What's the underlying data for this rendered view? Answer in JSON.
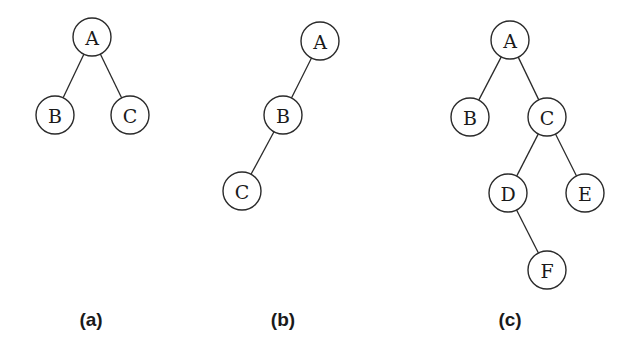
{
  "figure": {
    "node_radius": 19,
    "stroke_color": "#2a2a2a",
    "trees": [
      {
        "id": "a",
        "caption": "(a)",
        "caption_pos": {
          "x": 91,
          "y": 309
        },
        "nodes": [
          {
            "id": "A",
            "label": "A",
            "x": 92,
            "y": 37
          },
          {
            "id": "B",
            "label": "B",
            "x": 55,
            "y": 115
          },
          {
            "id": "C",
            "label": "C",
            "x": 130,
            "y": 115
          }
        ],
        "edges": [
          [
            "A",
            "B"
          ],
          [
            "A",
            "C"
          ]
        ]
      },
      {
        "id": "b",
        "caption": "(b)",
        "caption_pos": {
          "x": 283,
          "y": 309
        },
        "nodes": [
          {
            "id": "A",
            "label": "A",
            "x": 320,
            "y": 41
          },
          {
            "id": "B",
            "label": "B",
            "x": 283,
            "y": 115
          },
          {
            "id": "C",
            "label": "C",
            "x": 242,
            "y": 191
          }
        ],
        "edges": [
          [
            "A",
            "B"
          ],
          [
            "B",
            "C"
          ]
        ]
      },
      {
        "id": "c",
        "caption": "(c)",
        "caption_pos": {
          "x": 510,
          "y": 309
        },
        "nodes": [
          {
            "id": "A",
            "label": "A",
            "x": 510,
            "y": 40
          },
          {
            "id": "B",
            "label": "B",
            "x": 470,
            "y": 117
          },
          {
            "id": "C",
            "label": "C",
            "x": 547,
            "y": 117
          },
          {
            "id": "D",
            "label": "D",
            "x": 508,
            "y": 193
          },
          {
            "id": "E",
            "label": "E",
            "x": 585,
            "y": 193
          },
          {
            "id": "F",
            "label": "F",
            "x": 547,
            "y": 270
          }
        ],
        "edges": [
          [
            "A",
            "B"
          ],
          [
            "A",
            "C"
          ],
          [
            "C",
            "D"
          ],
          [
            "C",
            "E"
          ],
          [
            "D",
            "F"
          ]
        ]
      }
    ]
  }
}
